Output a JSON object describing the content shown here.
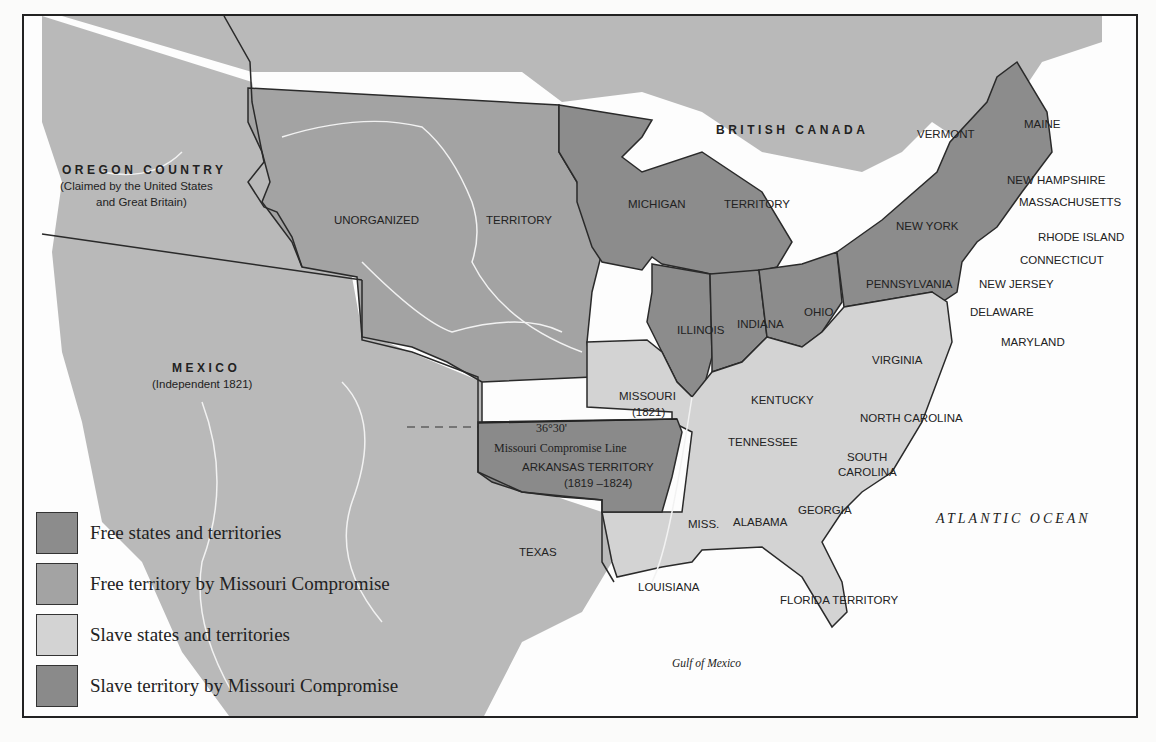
{
  "colors": {
    "free_states": "#8c8c8c",
    "free_territory_mc": "#a3a3a3",
    "slave_states": "#d3d3d3",
    "slave_territory_mc": "#8a8a8a",
    "foreign_land": "#b9b9b9",
    "water": "#fdfdfd",
    "border": "#2a2a2a",
    "river": "#f2f2f2"
  },
  "regions": {
    "british_canada": "BRITISH CANADA",
    "oregon_country": "OREGON COUNTRY",
    "oregon_note_1": "(Claimed by the United States",
    "oregon_note_2": "and Great Britain)",
    "mexico": "MEXICO",
    "mexico_note": "(Independent 1821)",
    "unorganized": "UNORGANIZED",
    "territory_word": "TERRITORY",
    "michigan": "MICHIGAN",
    "michigan_territory_word": "TERRITORY",
    "texas": "TEXAS"
  },
  "states": {
    "maine": "MAINE",
    "vermont": "VERMONT",
    "new_hampshire": "NEW HAMPSHIRE",
    "massachusetts": "MASSACHUSETTS",
    "rhode_island": "RHODE ISLAND",
    "connecticut": "CONNECTICUT",
    "new_york": "NEW YORK",
    "new_jersey": "NEW JERSEY",
    "pennsylvania": "PENNSYLVANIA",
    "delaware": "DELAWARE",
    "maryland": "MARYLAND",
    "ohio": "OHIO",
    "indiana": "INDIANA",
    "illinois": "ILLINOIS",
    "missouri": "MISSOURI",
    "missouri_year": "(1821)",
    "virginia": "VIRGINIA",
    "kentucky": "KENTUCKY",
    "north_carolina": "NORTH CAROLINA",
    "tennessee": "TENNESSEE",
    "south_carolina_1": "SOUTH",
    "south_carolina_2": "CAROLINA",
    "georgia": "GEORGIA",
    "alabama": "ALABAMA",
    "mississippi": "MISS.",
    "louisiana": "LOUISIANA",
    "florida": "FLORIDA TERRITORY",
    "arkansas": "ARKANSAS TERRITORY",
    "arkansas_years": "(1819 –1824)"
  },
  "compromise_line": {
    "latitude": "36°30'",
    "label": "Missouri Compromise Line"
  },
  "water_labels": {
    "atlantic": "ATLANTIC OCEAN",
    "gulf": "Gulf of Mexico"
  },
  "legend": {
    "items": [
      {
        "label": "Free states and territories",
        "color": "#8c8c8c"
      },
      {
        "label": "Free territory by Missouri Compromise",
        "color": "#a3a3a3"
      },
      {
        "label": "Slave states and territories",
        "color": "#d3d3d3"
      },
      {
        "label": "Slave territory by Missouri Compromise",
        "color": "#8a8a8a"
      }
    ]
  }
}
